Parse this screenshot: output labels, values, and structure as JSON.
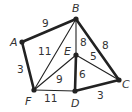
{
  "graph": {
    "vertices": [
      {
        "id": "A",
        "label": "A",
        "x": 22,
        "y": 42,
        "lx": 10,
        "ly": 46
      },
      {
        "id": "B",
        "label": "B",
        "x": 76,
        "y": 19,
        "lx": 72,
        "ly": 12
      },
      {
        "id": "C",
        "label": "C",
        "x": 119,
        "y": 80,
        "lx": 122,
        "ly": 88
      },
      {
        "id": "D",
        "label": "D",
        "x": 75,
        "y": 91,
        "lx": 71,
        "ly": 107
      },
      {
        "id": "E",
        "label": "E",
        "x": 76,
        "y": 55,
        "lx": 64,
        "ly": 55
      },
      {
        "id": "F",
        "label": "F",
        "x": 34,
        "y": 90,
        "lx": 25,
        "ly": 105
      }
    ],
    "edges": [
      {
        "from": "A",
        "to": "B",
        "weight": "9",
        "bold": true,
        "lx": 42,
        "ly": 27
      },
      {
        "from": "A",
        "to": "F",
        "weight": "3",
        "bold": true,
        "lx": 17,
        "ly": 73
      },
      {
        "from": "B",
        "to": "F",
        "weight": "11",
        "bold": false,
        "lx": 38,
        "ly": 55
      },
      {
        "from": "B",
        "to": "E",
        "weight": "8",
        "bold": false,
        "lx": 80,
        "ly": 46
      },
      {
        "from": "B",
        "to": "C",
        "weight": "8",
        "bold": true,
        "lx": 102,
        "ly": 49
      },
      {
        "from": "E",
        "to": "C",
        "weight": "5",
        "bold": false,
        "lx": 90,
        "ly": 60
      },
      {
        "from": "E",
        "to": "F",
        "weight": "9",
        "bold": false,
        "lx": 56,
        "ly": 83
      },
      {
        "from": "E",
        "to": "D",
        "weight": "6",
        "bold": true,
        "lx": 79,
        "ly": 78
      },
      {
        "from": "F",
        "to": "D",
        "weight": "11",
        "bold": false,
        "lx": 44,
        "ly": 102
      },
      {
        "from": "D",
        "to": "C",
        "weight": "3",
        "bold": true,
        "lx": 97,
        "ly": 99
      }
    ],
    "colors": {
      "line": "#222222",
      "text": "#333333"
    }
  }
}
